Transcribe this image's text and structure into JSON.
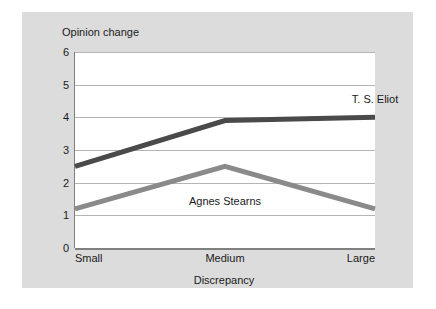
{
  "chart_data": {
    "type": "line",
    "title": "",
    "xlabel": "Discrepancy",
    "ylabel": "Opinion change",
    "categories": [
      "Small",
      "Medium",
      "Large"
    ],
    "ylim": [
      0,
      6
    ],
    "yticks": [
      0,
      1,
      2,
      3,
      4,
      5,
      6
    ],
    "grid": "horizontal",
    "legend_position": "inline-annotation",
    "series": [
      {
        "name": "T. S. Eliot",
        "values": [
          2.5,
          3.9,
          4.0
        ],
        "color": "#4a4a4a",
        "label_x": "Large",
        "label_value": 4.55
      },
      {
        "name": "Agnes Stearns",
        "values": [
          1.2,
          2.5,
          1.2
        ],
        "color": "#8a8a8a",
        "label_x": "Medium",
        "label_value": 1.45
      }
    ]
  },
  "figure": {
    "background_color": "#dcdcdc",
    "plot_background_color": "#ffffff",
    "axis_color": "#808080",
    "gridline_color": "#b4b4b4"
  }
}
